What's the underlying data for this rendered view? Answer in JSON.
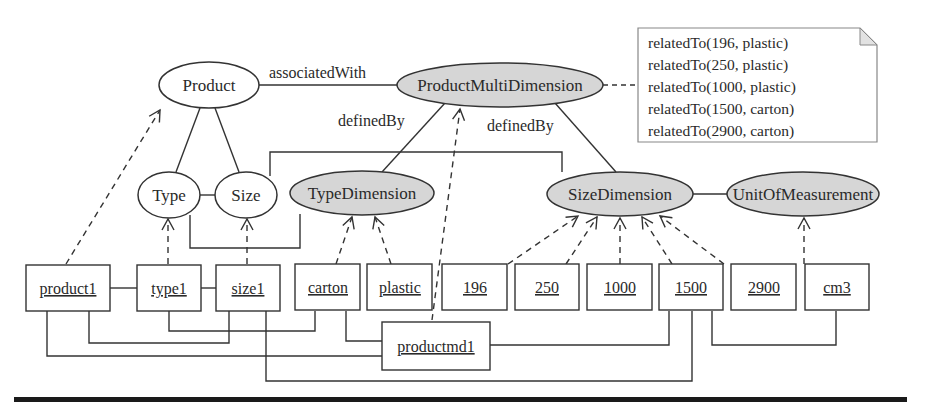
{
  "diagram": {
    "concepts": {
      "product": "Product",
      "type": "Type",
      "size": "Size",
      "product_multi_dimension": "ProductMultiDimension",
      "type_dimension": "TypeDimension",
      "size_dimension": "SizeDimension",
      "unit_of_measurement": "UnitOfMeasurement"
    },
    "relations": {
      "associated_with": "associatedWith",
      "defined_by_left": "definedBy",
      "defined_by_right": "definedBy"
    },
    "note": {
      "lines": [
        "relatedTo(196, plastic)",
        "relatedTo(250, plastic)",
        "relatedTo(1000, plastic)",
        "relatedTo(1500, carton)",
        "relatedTo(2900, carton)"
      ]
    },
    "instances": [
      "product1",
      "type1",
      "size1",
      "carton",
      "plastic",
      "196",
      "250",
      "1000",
      "1500",
      "2900",
      "cm3"
    ],
    "composite_instance": "productmd1",
    "colors": {
      "dimension_fill": "#d6d6d6",
      "concept_fill": "#ffffff",
      "stroke": "#333333",
      "rule": "#1a1a1a"
    }
  }
}
